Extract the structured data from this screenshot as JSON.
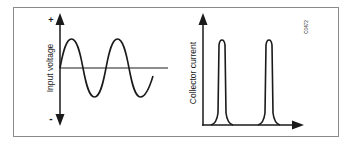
{
  "figure": {
    "frame_color": "#8a8a8a",
    "ink_color": "#1a1a1a",
    "reference_code": "C0472"
  },
  "left_graph": {
    "y_axis_label": "Input voltage",
    "top_sign": "+",
    "bottom_sign": "-",
    "waveform": "sine",
    "cycles": 2
  },
  "right_graph": {
    "y_axis_label": "Collector current",
    "waveform": "pulses",
    "pulse_count": 2
  }
}
